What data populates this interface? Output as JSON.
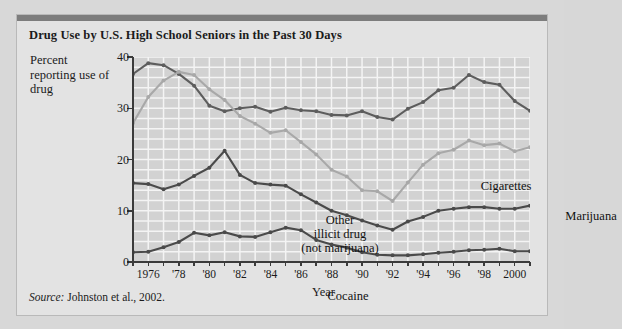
{
  "figure": {
    "title": "Drug Use by U.S. High School Seniors in the Past 30 Days",
    "source_prefix": "Source:",
    "source_text": " Johnston et al., 2002.",
    "frame_color": "#e3e3e3",
    "rule_color": "#7d7d7d",
    "page_background": "#d8d8d8"
  },
  "chart_data": {
    "type": "line",
    "title": "Drug Use by U.S. High School Seniors in the Past 30 Days",
    "xlabel": "Year",
    "ylabel": "Percent reporting use of drug",
    "ylim": [
      0,
      40
    ],
    "xlim": [
      1975,
      2001
    ],
    "yticks": [
      0,
      10,
      20,
      30,
      40
    ],
    "ytick_labels": [
      "0",
      "10",
      "20",
      "30",
      "40"
    ],
    "xticks": [
      1976,
      1978,
      1980,
      1982,
      1984,
      1986,
      1988,
      1990,
      1992,
      1994,
      1996,
      1998,
      2000
    ],
    "xtick_labels": [
      "1976",
      "'78",
      "'80",
      "'82",
      "'84",
      "'86",
      "'88",
      "'90",
      "'92",
      "'94",
      "'96",
      "'98",
      "2000"
    ],
    "grid": true,
    "grid_color": "#f4f4f4",
    "plot_background": "#d2d2d2",
    "legend": "inline-labels",
    "x": [
      1975,
      1976,
      1977,
      1978,
      1979,
      1980,
      1981,
      1982,
      1983,
      1984,
      1985,
      1986,
      1987,
      1988,
      1989,
      1990,
      1991,
      1992,
      1993,
      1994,
      1995,
      1996,
      1997,
      1998,
      1999,
      2000,
      2001
    ],
    "series": [
      {
        "name": "Cigarettes",
        "color": "#5d5d5d",
        "marker": "circle",
        "values": [
          36.7,
          38.8,
          38.4,
          36.7,
          34.4,
          30.5,
          29.4,
          30.0,
          30.3,
          29.3,
          30.1,
          29.6,
          29.4,
          28.7,
          28.6,
          29.4,
          28.3,
          27.8,
          29.9,
          31.2,
          33.5,
          34.0,
          36.5,
          35.1,
          34.6,
          31.4,
          29.5
        ]
      },
      {
        "name": "Marijuana",
        "color": "#a8a8a8",
        "marker": "circle",
        "values": [
          27.1,
          32.2,
          35.4,
          37.1,
          36.5,
          33.7,
          31.6,
          28.5,
          27.0,
          25.2,
          25.7,
          23.4,
          21.0,
          18.0,
          16.7,
          14.0,
          13.8,
          11.9,
          15.5,
          19.0,
          21.2,
          21.9,
          23.7,
          22.8,
          23.1,
          21.6,
          22.4
        ]
      },
      {
        "name": "Other illicit drug (not marijuana)",
        "color": "#4a4a4a",
        "marker": "circle",
        "values": [
          15.4,
          15.2,
          14.2,
          15.1,
          16.8,
          18.4,
          21.7,
          17.0,
          15.4,
          15.1,
          14.9,
          13.2,
          11.6,
          10.0,
          9.1,
          8.1,
          7.1,
          6.3,
          7.9,
          8.8,
          10.0,
          10.4,
          10.7,
          10.7,
          10.4,
          10.4,
          11.0
        ]
      },
      {
        "name": "Cocaine",
        "color": "#4a4a4a",
        "marker": "circle",
        "values": [
          1.9,
          2.0,
          2.9,
          3.9,
          5.7,
          5.2,
          5.8,
          5.0,
          4.9,
          5.8,
          6.7,
          6.2,
          4.3,
          3.4,
          2.8,
          1.9,
          1.4,
          1.3,
          1.3,
          1.5,
          1.8,
          2.0,
          2.3,
          2.4,
          2.6,
          2.1,
          2.1
        ]
      }
    ],
    "annotations": [
      {
        "text": "Cigarettes",
        "series": "Cigarettes"
      },
      {
        "text": "Marijuana",
        "series": "Marijuana"
      },
      {
        "text": "Other illicit drug (not marijuana)",
        "series": "Other illicit drug (not marijuana)"
      },
      {
        "text": "Cocaine",
        "series": "Cocaine"
      }
    ]
  },
  "labels": {
    "other_line1": "Other",
    "other_line2": "illicit drug",
    "other_line3": "(not marijuana)",
    "cocaine": "Cocaine",
    "cigarettes": "Cigarettes",
    "marijuana": "Marijuana"
  }
}
